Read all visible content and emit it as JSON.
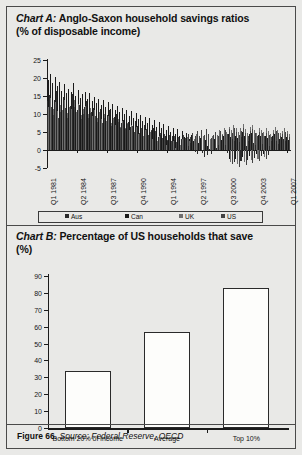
{
  "figure": {
    "footer_figure": "Figure 66.",
    "footer_source": "Source: Federal Reserve, OECD"
  },
  "chart_data": [
    {
      "type": "bar",
      "id": "chart-a",
      "title_prefix": "Chart A:",
      "title": "Anglo-Saxon household savings ratios",
      "subtitle": "(% of disposable income)",
      "ylabel": "",
      "xlabel": "",
      "ylim": [
        -5,
        25
      ],
      "yticks": [
        25,
        20,
        15,
        10,
        5,
        0,
        -5
      ],
      "grid": false,
      "legend_position": "bottom",
      "legend": [
        "Aus",
        "Can",
        "UK",
        "US"
      ],
      "series_colors": [
        "#2b2b2b",
        "#1a1a1a",
        "#6e6e6e",
        "#434343"
      ],
      "xtick_labels": [
        "Q1 1981",
        "Q2 1984",
        "Q3 1987",
        "Q4 1990",
        "Q1 1994",
        "Q2 1997",
        "Q3 2000",
        "Q4 2003",
        "Q1 2007"
      ],
      "series": [
        {
          "name": "Aus",
          "values": [
            13.5,
            15.2,
            12.8,
            14.0,
            16.5,
            13.2,
            12.0,
            14.8,
            11.5,
            13.0,
            12.2,
            15.5,
            13.8,
            11.0,
            12.5,
            10.8,
            12.0,
            13.5,
            11.2,
            10.5,
            11.8,
            9.5,
            10.2,
            11.5,
            9.0,
            10.8,
            9.8,
            11.0,
            8.5,
            9.2,
            10.0,
            8.8,
            7.5,
            8.2,
            9.0,
            7.8,
            6.5,
            7.2,
            8.0,
            6.8,
            5.5,
            6.2,
            7.0,
            5.8,
            4.5,
            5.2,
            6.0,
            4.8,
            3.5,
            4.2,
            5.0,
            3.8,
            2.5,
            3.2,
            4.0,
            2.8,
            1.5,
            2.2,
            3.0,
            1.8,
            0.5,
            1.2,
            2.0,
            0.8,
            -0.5,
            -1.2,
            0.5,
            -0.8,
            -2.0,
            -1.5,
            0.2,
            -1.0,
            1.0,
            0.5,
            1.5,
            1.0,
            2.0,
            1.5,
            2.5,
            2.0,
            3.0,
            2.5,
            1.5,
            2.2,
            3.5,
            2.0,
            1.0,
            2.5,
            3.0,
            2.0,
            1.5,
            2.8,
            2.2,
            1.8,
            2.5,
            2.0,
            1.2,
            2.4,
            3.2,
            2.6,
            1.8,
            2.2,
            3.0,
            2.4,
            1.6
          ]
        },
        {
          "name": "Can",
          "values": [
            19.5,
            21.0,
            18.5,
            20.2,
            17.8,
            19.0,
            16.5,
            18.2,
            15.8,
            17.0,
            16.2,
            18.5,
            15.0,
            16.8,
            14.5,
            15.5,
            16.0,
            14.2,
            15.8,
            13.5,
            14.8,
            13.0,
            14.2,
            12.5,
            13.8,
            12.0,
            13.2,
            11.5,
            12.8,
            11.0,
            12.2,
            10.5,
            11.8,
            10.0,
            11.2,
            9.5,
            10.8,
            9.0,
            10.2,
            8.5,
            9.8,
            8.0,
            9.2,
            7.5,
            8.8,
            7.0,
            8.2,
            6.5,
            7.8,
            6.0,
            7.2,
            5.5,
            6.8,
            5.0,
            6.2,
            4.5,
            5.8,
            4.0,
            5.2,
            3.5,
            4.8,
            3.0,
            4.2,
            2.5,
            3.8,
            2.0,
            3.2,
            1.5,
            2.8,
            1.0,
            2.2,
            1.8,
            3.0,
            2.4,
            3.6,
            2.8,
            4.0,
            3.2,
            4.4,
            3.6,
            4.8,
            4.0,
            3.2,
            4.2,
            5.0,
            3.8,
            3.0,
            4.4,
            4.8,
            3.6,
            3.0,
            4.2,
            3.8,
            3.2,
            4.0,
            3.4,
            2.8,
            3.8,
            4.4,
            3.8,
            3.0,
            3.6,
            4.2,
            3.6,
            2.8
          ]
        },
        {
          "name": "UK",
          "values": [
            12.0,
            14.5,
            11.5,
            13.2,
            10.8,
            12.5,
            11.0,
            13.8,
            10.2,
            12.0,
            11.5,
            14.0,
            10.5,
            12.8,
            9.8,
            11.5,
            12.2,
            10.0,
            11.8,
            9.5,
            11.0,
            9.0,
            10.5,
            8.5,
            10.0,
            8.0,
            9.5,
            7.5,
            9.0,
            7.0,
            8.5,
            6.5,
            8.0,
            6.0,
            7.5,
            5.5,
            7.0,
            5.0,
            6.5,
            4.5,
            6.0,
            4.0,
            5.5,
            3.5,
            5.0,
            3.0,
            4.5,
            2.5,
            4.0,
            2.0,
            3.5,
            1.5,
            3.0,
            1.0,
            2.5,
            0.5,
            2.0,
            1.5,
            3.0,
            2.0,
            3.5,
            2.5,
            4.0,
            3.0,
            4.5,
            3.5,
            5.0,
            4.0,
            5.5,
            4.5,
            3.0,
            4.0,
            5.0,
            4.2,
            5.5,
            4.5,
            6.0,
            5.0,
            6.5,
            5.5,
            7.0,
            6.0,
            5.0,
            6.2,
            7.2,
            5.8,
            4.8,
            6.4,
            7.0,
            5.6,
            4.8,
            6.2,
            5.6,
            5.0,
            6.0,
            5.2,
            4.4,
            5.6,
            6.4,
            5.6,
            4.6,
            5.4,
            6.2,
            5.4,
            4.4
          ]
        },
        {
          "name": "US",
          "values": [
            10.5,
            12.0,
            9.8,
            11.2,
            9.0,
            10.5,
            9.5,
            11.8,
            8.8,
            10.2,
            9.8,
            12.0,
            9.0,
            11.0,
            8.5,
            10.0,
            10.5,
            8.8,
            10.2,
            8.2,
            9.5,
            7.8,
            9.0,
            7.5,
            8.8,
            7.2,
            8.5,
            6.8,
            8.2,
            6.5,
            7.8,
            6.0,
            7.5,
            5.8,
            7.2,
            5.5,
            6.8,
            5.0,
            6.5,
            4.8,
            6.2,
            4.5,
            5.8,
            4.2,
            5.5,
            3.8,
            5.2,
            3.5,
            4.8,
            3.2,
            4.5,
            2.8,
            4.2,
            2.5,
            3.8,
            2.2,
            3.5,
            2.8,
            4.2,
            3.2,
            4.5,
            3.5,
            4.8,
            3.8,
            5.2,
            4.0,
            5.5,
            4.2,
            5.8,
            4.5,
            3.2,
            4.2,
            5.0,
            4.0,
            5.2,
            4.2,
            5.5,
            4.5,
            5.8,
            4.8,
            6.0,
            5.0,
            4.2,
            5.2,
            6.0,
            4.8,
            4.0,
            5.4,
            5.8,
            4.6,
            4.0,
            5.0,
            4.6,
            4.0,
            4.8,
            4.2,
            3.6,
            4.6,
            5.2,
            4.6,
            3.8,
            4.4,
            5.0,
            4.4,
            3.6
          ]
        }
      ],
      "negatives_tail": [
        -0.8,
        -2.4,
        -3.2,
        -4.0,
        -3.4,
        -2.6,
        -3.8,
        -4.6,
        -3.0,
        -2.0,
        -3.4,
        -4.2,
        -2.8,
        -1.6,
        -2.8,
        -3.6,
        -2.2,
        -1.2,
        -2.4,
        -3.0,
        -1.8,
        -1.0,
        -2.0,
        -2.6,
        -1.4
      ]
    },
    {
      "type": "bar",
      "id": "chart-b",
      "title_prefix": "Chart B:",
      "title": "Percentage of US households that save",
      "subtitle": "(%)",
      "xlabel": "",
      "ylabel": "",
      "ylim": [
        0,
        90
      ],
      "yticks": [
        90,
        80,
        70,
        60,
        50,
        40,
        30,
        20,
        10,
        0
      ],
      "grid": false,
      "categories": [
        "Bottom 20% of income",
        "Average",
        "Top 10%"
      ],
      "values": [
        34,
        57,
        83
      ],
      "bar_fill": "#fdfdfb",
      "bar_stroke": "#2a2a2a"
    }
  ]
}
